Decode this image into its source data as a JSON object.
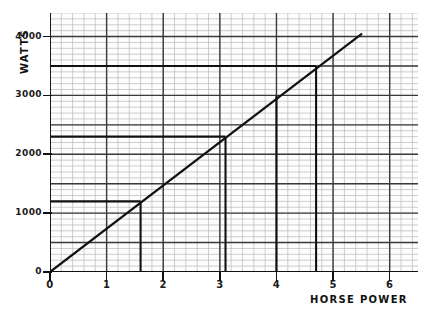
{
  "chart_data": {
    "type": "line",
    "title": "",
    "xlabel": "Horse Power",
    "ylabel": "Watts",
    "xlim": [
      0,
      6.5
    ],
    "ylim": [
      0,
      4400
    ],
    "xticks": [
      0,
      1,
      2,
      3,
      4,
      5,
      6
    ],
    "xticklabels": [
      "0",
      "1",
      "2",
      "3",
      "4",
      "5",
      "6"
    ],
    "yticks": [
      0,
      1000,
      2000,
      3000,
      4000
    ],
    "yticklabels": [
      "0",
      "1000",
      "2000",
      "3000",
      "4000"
    ],
    "grid": true,
    "grid_minor_spacing_x": 0.2,
    "grid_minor_spacing_y": 100,
    "grid_major_spacing_x": 1,
    "grid_major_spacing_y": 500,
    "legend": "none",
    "series": [
      {
        "name": "Watts vs Horse Power",
        "x": [
          0,
          5.5
        ],
        "y": [
          0,
          4040
        ],
        "slope_watts_per_hp": 735
      }
    ],
    "annotations": [
      {
        "label": "point-1",
        "x": 1.6,
        "y": 1200,
        "guide": "both"
      },
      {
        "label": "point-2",
        "x": 3.1,
        "y": 2300,
        "guide": "both"
      },
      {
        "label": "point-3",
        "x": 4.0,
        "y": 3000,
        "guide": "vertical"
      },
      {
        "label": "point-4",
        "x": 4.7,
        "y": 3500,
        "guide": "both"
      }
    ],
    "colors": {
      "line": "#111111",
      "guide": "#111111",
      "grid_major": "#3a3a3a",
      "grid_minor": "#b9b9bd",
      "axis": "#111111",
      "background": "#ffffff"
    }
  },
  "axes": {
    "y_title": "WATTS",
    "x_title": "HORSE POWER"
  }
}
